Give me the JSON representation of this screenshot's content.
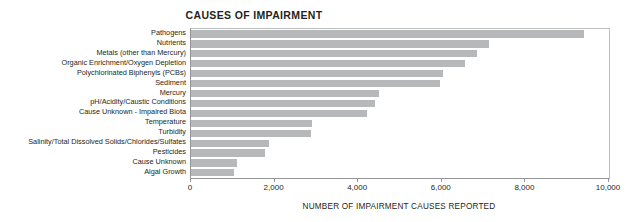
{
  "chart_data": {
    "type": "bar",
    "orientation": "horizontal",
    "title": "CAUSES OF IMPAIRMENT",
    "xlabel": "NUMBER OF IMPAIRMENT CAUSES REPORTED",
    "ylabel": "",
    "xlim": [
      0,
      10000
    ],
    "xticks": [
      0,
      2000,
      4000,
      6000,
      8000,
      10000
    ],
    "xtick_labels": [
      "0",
      "2,000",
      "4,000",
      "6,000",
      "8,000",
      "10,000"
    ],
    "grid": false,
    "legend": null,
    "bar_color": "#b7b8ba",
    "axis_color": "#939598",
    "categories": [
      "Pathogens",
      "Nutrients",
      "Metals (other than Mercury)",
      "Organic Enrichment/Oxygen Depletion",
      "Polychlorinated Biphenyls (PCBs)",
      "Sediment",
      "Mercury",
      "pH/Acidity/Caustic Conditions",
      "Cause Unknown - Impaired Biota",
      "Temperature",
      "Turbidity",
      "Salinity/Total Dissolved Solids/Chlorides/Sulfates",
      "Pesticides",
      "Cause Unknown",
      "Algal Growth"
    ],
    "values": [
      9400,
      7130,
      6840,
      6560,
      6030,
      5950,
      4500,
      4400,
      4200,
      2900,
      2870,
      1870,
      1770,
      1100,
      1030
    ]
  }
}
